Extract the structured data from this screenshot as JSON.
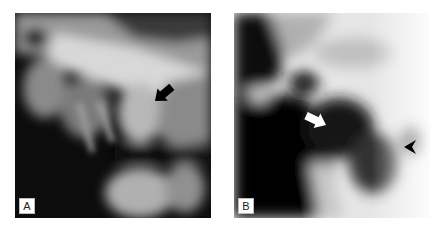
{
  "figure": {
    "panels": [
      {
        "id": "A",
        "label": "A",
        "description": "Radiograph with black arrow pointing to rounded structure",
        "annotations": [
          {
            "type": "arrow",
            "color": "#000000",
            "direction": "down-left"
          }
        ]
      },
      {
        "id": "B",
        "label": "B",
        "description": "Radiograph with white arrow and black arrowhead",
        "annotations": [
          {
            "type": "arrow",
            "color": "#ffffff",
            "direction": "right-down"
          },
          {
            "type": "arrowhead",
            "color": "#000000",
            "direction": "left"
          }
        ]
      }
    ]
  }
}
